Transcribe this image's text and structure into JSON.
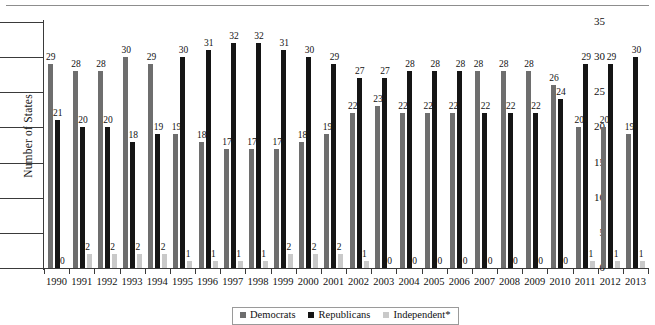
{
  "chart_data": {
    "type": "bar",
    "title": "",
    "xlabel": "",
    "ylabel": "Number of States",
    "ylim": [
      0,
      35
    ],
    "yticks": [
      0,
      5,
      10,
      15,
      20,
      25,
      30,
      35
    ],
    "grid": false,
    "legend_position": "bottom-center",
    "categories": [
      "1990",
      "1991",
      "1992",
      "1993",
      "1994",
      "1995",
      "1996",
      "1997",
      "1998",
      "1999",
      "2000",
      "2001",
      "2002",
      "2003",
      "2004",
      "2005",
      "2006",
      "2007",
      "2008",
      "2009",
      "2010",
      "2011",
      "2012",
      "2013"
    ],
    "series": [
      {
        "name": "Democrats",
        "color": "#6e6e6e",
        "values": [
          29,
          28,
          28,
          30,
          29,
          19,
          18,
          17,
          17,
          17,
          18,
          19,
          22,
          23,
          22,
          22,
          22,
          28,
          28,
          28,
          26,
          20,
          20,
          19
        ]
      },
      {
        "name": "Republicans",
        "color": "#151515",
        "values": [
          21,
          20,
          20,
          18,
          19,
          30,
          31,
          32,
          32,
          31,
          30,
          29,
          27,
          27,
          28,
          28,
          28,
          22,
          22,
          22,
          24,
          29,
          29,
          30
        ]
      },
      {
        "name": "Independent*",
        "color": "#c9c9c9",
        "values": [
          0,
          2,
          2,
          2,
          2,
          1,
          1,
          1,
          1,
          2,
          2,
          2,
          1,
          0,
          0,
          0,
          0,
          0,
          0,
          0,
          0,
          1,
          1,
          1
        ]
      }
    ]
  },
  "axis": {
    "y_title": "Number of States"
  },
  "legend": {
    "items": [
      {
        "label": "Democrats",
        "swatch": "dem"
      },
      {
        "label": "Republicans",
        "swatch": "rep"
      },
      {
        "label": "Independent*",
        "swatch": "ind"
      }
    ]
  }
}
